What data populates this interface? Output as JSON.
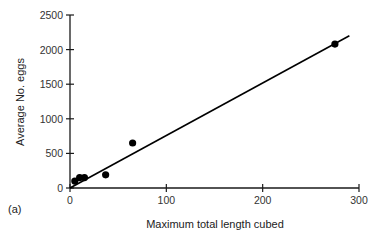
{
  "chart_data": {
    "type": "scatter",
    "title": "",
    "panel_label": "(a)",
    "xlabel": "Maximum total length cubed",
    "ylabel": "Average No. eggs",
    "xlim": [
      0,
      300
    ],
    "ylim": [
      0,
      2500
    ],
    "xticks": [
      0,
      100,
      200,
      300
    ],
    "yticks": [
      0,
      500,
      1000,
      1500,
      2000,
      2500
    ],
    "grid": false,
    "legend": null,
    "series": [
      {
        "name": "observations",
        "type": "scatter",
        "x": [
          5,
          10,
          15,
          37,
          65,
          275
        ],
        "y": [
          100,
          150,
          150,
          190,
          650,
          2080
        ]
      },
      {
        "name": "regression line",
        "type": "line",
        "x": [
          0,
          290
        ],
        "y": [
          0,
          2200
        ]
      }
    ]
  },
  "colors": {
    "axis": "#1a1a1a",
    "points": "#000000",
    "line": "#000000",
    "text": "#333333"
  }
}
